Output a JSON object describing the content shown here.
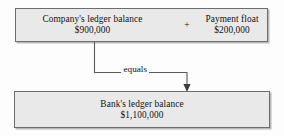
{
  "figure": {
    "name": "ledger-balance-relationship-diagram",
    "background_color": "#fdfdfd",
    "box_fill_color": "#e9e9e9",
    "box_border_color": "#6d6d6d",
    "text_color": "#121212",
    "connector_color": "#5a5a5a"
  },
  "top_box": {
    "operator": "+",
    "left_item": {
      "label": "Company's ledger balance",
      "amount": "$900,000"
    },
    "right_item": {
      "label": "Payment float",
      "amount": "$200,000"
    }
  },
  "connector": {
    "label": "equals",
    "arrow_icon": "arrow-down-icon"
  },
  "bottom_box": {
    "label": "Bank's ledger balance",
    "amount": "$1,100,000"
  }
}
